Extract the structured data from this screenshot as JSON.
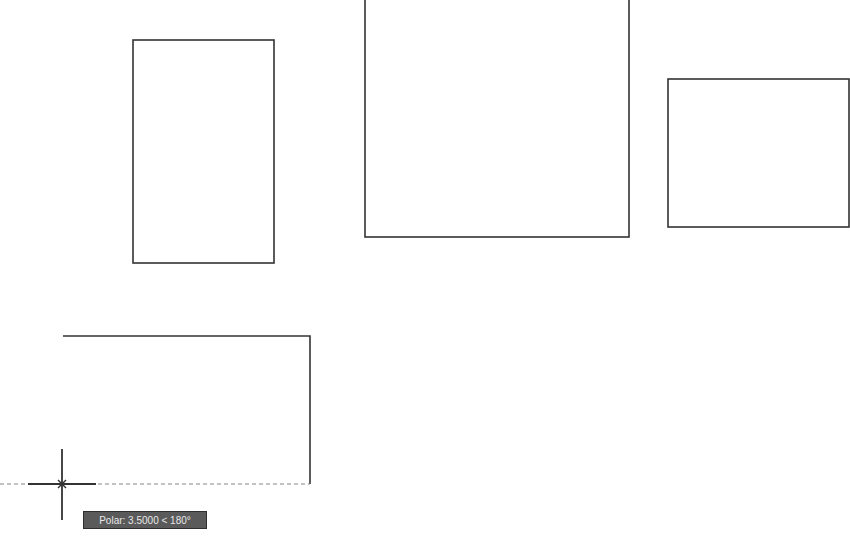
{
  "app": {
    "type": "CAD drawing viewport",
    "background": "#ffffff",
    "line_color": "#333333"
  },
  "drawing": {
    "rectangles": [
      {
        "id": "rect-1",
        "x": 133,
        "y": 40,
        "width": 141,
        "height": 223
      },
      {
        "id": "rect-2",
        "x": 365,
        "y": -10,
        "width": 264,
        "height": 247
      },
      {
        "id": "rect-3",
        "x": 668,
        "y": 79,
        "width": 181,
        "height": 148
      }
    ],
    "polyline_in_progress": {
      "points": [
        [
          63,
          336
        ],
        [
          310,
          336
        ],
        [
          310,
          484
        ]
      ],
      "rubber_band_to": [
        62,
        484
      ]
    },
    "tracking_line": {
      "y": 484,
      "x_start": 0,
      "x_end": 310
    }
  },
  "cursor": {
    "icon": "crosshair-icon",
    "x": 62,
    "y": 484,
    "snap_marker": "x-marker-icon"
  },
  "tooltip": {
    "label": "Polar: 3.5000 < 180°",
    "mode": "Polar",
    "distance": "3.5000",
    "angle": "180°"
  }
}
